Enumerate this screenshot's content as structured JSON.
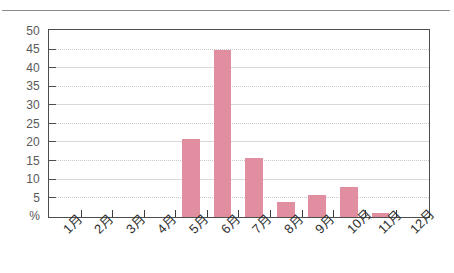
{
  "chart_data": {
    "type": "bar",
    "title": "",
    "subtitle": "",
    "xlabel": "",
    "ylabel": "%",
    "categories": [
      "1月",
      "2月",
      "3月",
      "4月",
      "5月",
      "6月",
      "7月",
      "8月",
      "9月",
      "10月",
      "11月",
      "12月"
    ],
    "values": [
      0,
      0,
      0,
      0,
      21,
      45,
      16,
      4,
      6,
      8,
      1,
      0
    ],
    "ylim": [
      0,
      50
    ],
    "yticks": [
      0,
      5,
      10,
      15,
      20,
      25,
      30,
      35,
      40,
      45,
      50
    ],
    "ytick_labels": [
      "%",
      "5",
      "10",
      "15",
      "20",
      "25",
      "30",
      "35",
      "40",
      "45",
      "50"
    ],
    "grid": true,
    "legend": false,
    "legend_position": "none",
    "bar_color": "#e18fa0",
    "axis_color": "#4d4d4d",
    "grid_color": "#c9c6cc",
    "series": [
      {
        "name": "",
        "values": [
          0,
          0,
          0,
          0,
          21,
          45,
          16,
          4,
          6,
          8,
          1,
          0
        ]
      }
    ]
  }
}
